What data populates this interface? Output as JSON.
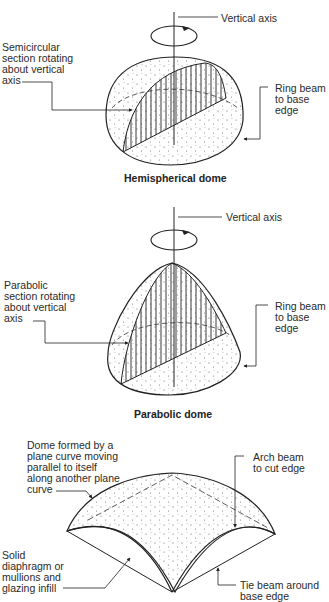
{
  "figure": {
    "panels": [
      {
        "id": "hemispherical",
        "caption": "Hemispherical dome",
        "labels": {
          "axis": "Vertical axis",
          "section": "Semicircular\nsection rotating\nabout vertical\naxis",
          "ring": "Ring beam\nto base\nedge"
        }
      },
      {
        "id": "parabolic",
        "caption": "Parabolic dome",
        "labels": {
          "axis": "Vertical axis",
          "section": "Parabolic\nsection rotating\nabout vertical\naxis",
          "ring": "Ring beam\nto base\nedge"
        }
      },
      {
        "id": "translational",
        "labels": {
          "dome": "Dome formed by a\nplane curve moving\nparallel to itself\nalong another plane\ncurve",
          "arch": "Arch beam\nto cut edge",
          "diaphragm": "Solid\ndiaphragm or\nmullions and\nglazing infill",
          "tie": "Tie beam around\nbase edge"
        }
      }
    ]
  }
}
